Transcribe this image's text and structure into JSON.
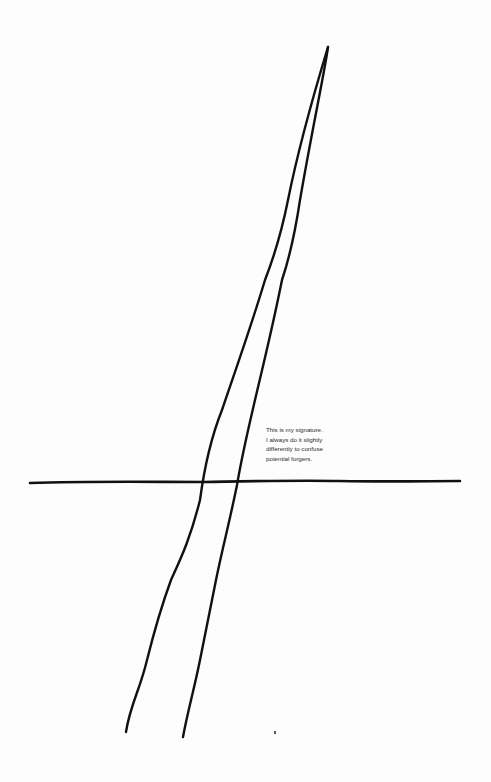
{
  "caption": {
    "lines": [
      "This is my signature.",
      "I always do it slightly",
      "differently to confuse",
      "potential forgers."
    ]
  },
  "colors": {
    "background": "#fdfdfd",
    "ink": "#111111",
    "text": "#2a2a2a"
  }
}
